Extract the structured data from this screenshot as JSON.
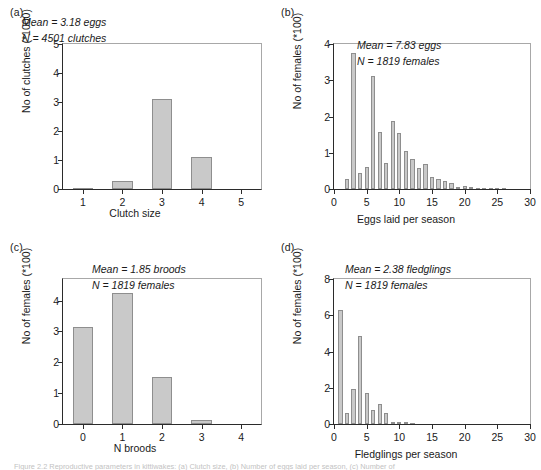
{
  "figure": {
    "caption_partial": "Figure 2.2  Reproductive parameters in kittiwakes: (a) Clutch size, (b) Number of eggs laid per season, (c) Number of"
  },
  "panels": [
    {
      "letter": "(a)",
      "annotation": [
        "Mean = 3.18 eggs",
        "N = 4501 clutches"
      ],
      "chart_data": {
        "type": "bar",
        "title": "",
        "xlabel": "Clutch size",
        "ylabel": "No of clutches (*1000)",
        "categories": [
          "1",
          "2",
          "3",
          "4",
          "5"
        ],
        "values": [
          0.04,
          0.27,
          3.11,
          1.11,
          0.0
        ],
        "xticks": [
          "1",
          "2",
          "3",
          "4",
          "5"
        ],
        "yticks": [
          "0",
          "1",
          "2",
          "3",
          "4",
          "5"
        ],
        "ylim": [
          0,
          5
        ],
        "grid": false,
        "legend": "none"
      }
    },
    {
      "letter": "(b)",
      "annotation": [
        "Mean = 7.83 eggs",
        "N = 1819 females"
      ],
      "chart_data": {
        "type": "bar",
        "title": "",
        "xlabel": "Eggs laid per season",
        "ylabel": "No of females (*100)",
        "x": [
          1,
          2,
          3,
          4,
          5,
          6,
          7,
          8,
          9,
          10,
          11,
          12,
          13,
          14,
          15,
          16,
          17,
          18,
          19,
          20,
          21,
          22,
          23,
          24,
          25,
          26,
          27,
          28,
          29,
          30
        ],
        "values": [
          0.0,
          0.28,
          3.75,
          0.43,
          0.6,
          3.11,
          1.56,
          0.72,
          1.89,
          1.54,
          1.04,
          0.83,
          0.58,
          0.68,
          0.33,
          0.28,
          0.21,
          0.17,
          0.06,
          0.07,
          0.04,
          0.02,
          0.02,
          0.02,
          0.01,
          0.01,
          0.0,
          0.0,
          0.0,
          0.0
        ],
        "xticks": [
          "0",
          "5",
          "10",
          "15",
          "20",
          "25",
          "30"
        ],
        "yticks": [
          "0",
          "1",
          "2",
          "3",
          "4"
        ],
        "xlim": [
          0,
          30
        ],
        "ylim": [
          0,
          4
        ],
        "grid": false,
        "legend": "none"
      }
    },
    {
      "letter": "(c)",
      "annotation": [
        "Mean = 1.85 broods",
        "N = 1819 females"
      ],
      "chart_data": {
        "type": "bar",
        "title": "",
        "xlabel": "N broods",
        "ylabel": "No of females (*100)",
        "categories": [
          "0",
          "1",
          "2",
          "3",
          "4"
        ],
        "values": [
          3.13,
          4.26,
          1.53,
          0.14,
          0.0
        ],
        "xticks": [
          "0",
          "1",
          "2",
          "3",
          "4"
        ],
        "yticks": [
          "0",
          "1",
          "2",
          "3",
          "4"
        ],
        "ylim": [
          0,
          4.7
        ],
        "grid": false,
        "legend": "none"
      }
    },
    {
      "letter": "(d)",
      "annotation": [
        "Mean = 2.38 fledglings",
        "N = 1819 females"
      ],
      "chart_data": {
        "type": "bar",
        "title": "",
        "xlabel": "Fledglings per season",
        "ylabel": "No of females (*100)",
        "x": [
          1,
          2,
          3,
          4,
          5,
          6,
          7,
          8,
          9,
          10,
          11,
          12,
          13,
          14,
          15,
          16,
          17,
          18,
          19,
          20,
          21,
          22,
          23,
          24,
          25,
          26,
          27,
          28,
          29,
          30
        ],
        "values": [
          6.28,
          0.63,
          1.93,
          4.83,
          1.72,
          0.8,
          1.12,
          0.62,
          0.13,
          0.1,
          0.07,
          0.04,
          0.0,
          0.0,
          0.0,
          0.0,
          0.0,
          0.0,
          0.0,
          0.0,
          0.0,
          0.0,
          0.0,
          0.0,
          0.0,
          0.0,
          0.0,
          0.0,
          0.0,
          0.0
        ],
        "xticks": [
          "0",
          "5",
          "10",
          "15",
          "20",
          "25",
          "30"
        ],
        "yticks": [
          "0",
          "2",
          "4",
          "6",
          "8"
        ],
        "xlim": [
          0,
          30
        ],
        "ylim": [
          0,
          8
        ],
        "grid": false,
        "legend": "none"
      }
    }
  ],
  "colors": {
    "bar_fill": "#c9c9c9",
    "bar_stroke": "#8e8e8e",
    "axis": "#2b2b2b",
    "frame_light": "#a8a8a8",
    "text": "#1a1a1a"
  }
}
